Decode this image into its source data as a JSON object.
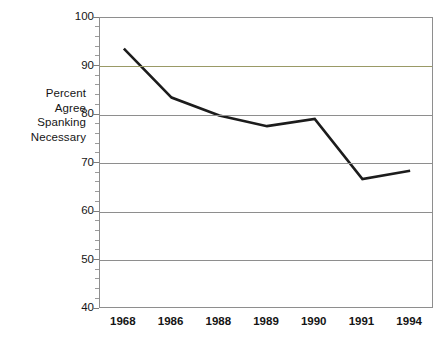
{
  "chart_data": {
    "type": "line",
    "title": "",
    "xlabel": "",
    "ylabel": "Percent Agree Spanking Necessary",
    "ylabel_lines": [
      "Percent",
      "Agree",
      "Spanking",
      "Necessary"
    ],
    "categories": [
      "1968",
      "1986",
      "1988",
      "1989",
      "1990",
      "1991",
      "1994"
    ],
    "values": [
      93.7,
      83.6,
      79.9,
      77.7,
      79.2,
      66.8,
      68.5
    ],
    "series": [
      {
        "name": "Percent Agree Spanking Necessary",
        "values": [
          93.7,
          83.6,
          79.9,
          77.7,
          79.2,
          66.8,
          68.5
        ],
        "color": "#1c1c1c"
      }
    ],
    "ylim": [
      40,
      100
    ],
    "yticks": [
      40,
      50,
      60,
      70,
      80,
      90,
      100
    ],
    "ytick_labels": [
      "40",
      "50",
      "60",
      "70",
      "80",
      "90",
      "100"
    ],
    "y_minor_tick_step": 2,
    "grid": true,
    "grid_color": "#8e8e8e",
    "highlight_gridline_value": 90,
    "highlight_gridline_color": "#9a9a66",
    "legend": false,
    "legend_position": "none",
    "frame_color": "#8e8e8e",
    "background_color": "#ffffff"
  }
}
